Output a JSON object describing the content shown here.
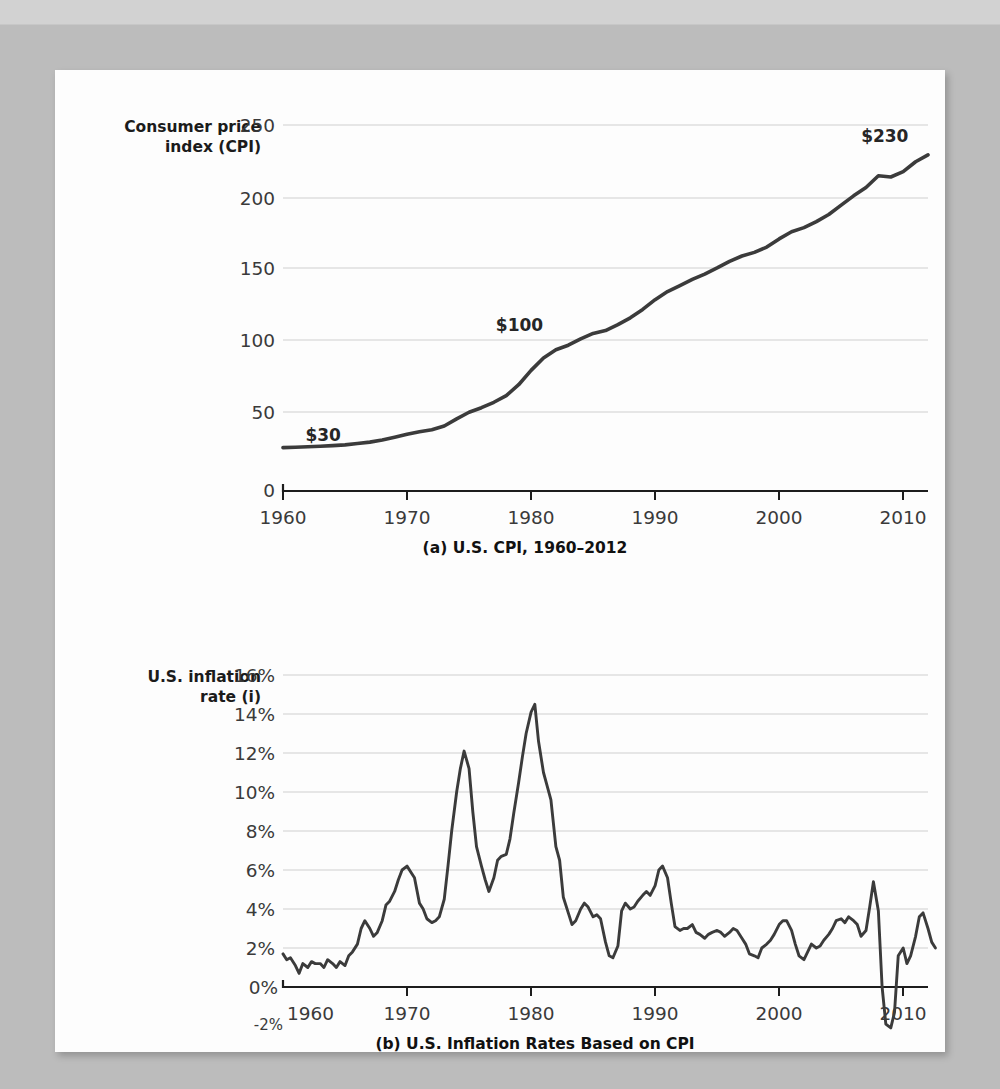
{
  "document": {
    "background_color": "#bcbcbc",
    "card_color": "#fdfdfd"
  },
  "chart_data": [
    {
      "type": "line",
      "id": "cpi",
      "title": "(a) U.S. CPI, 1960–2012",
      "ylabel_line1": "Consumer price",
      "ylabel_line2": "index (CPI)",
      "xlabel": "",
      "xlim": [
        1960,
        2012
      ],
      "ylim": [
        0,
        250
      ],
      "grid": true,
      "legend": "none",
      "yticks": [
        0,
        50,
        100,
        150,
        200,
        250
      ],
      "ytick_labels": [
        "0",
        "50",
        "100",
        "150",
        "200",
        "250"
      ],
      "xticks": [
        1960,
        1970,
        1980,
        1990,
        2000,
        2010
      ],
      "xtick_labels": [
        "1960",
        "1970",
        "1980",
        "1990",
        "2000",
        "2010"
      ],
      "annotations": [
        {
          "text": "$30",
          "x": 1961,
          "y": 29
        },
        {
          "text": "$100",
          "x": 1981,
          "y": 100
        },
        {
          "text": "$230",
          "x": 2009,
          "y": 230
        }
      ],
      "series_name": "U.S. Consumer Price Index",
      "x": [
        1960,
        1961,
        1962,
        1963,
        1964,
        1965,
        1966,
        1967,
        1968,
        1969,
        1970,
        1971,
        1972,
        1973,
        1974,
        1975,
        1976,
        1977,
        1978,
        1979,
        1980,
        1981,
        1982,
        1983,
        1984,
        1985,
        1986,
        1987,
        1988,
        1989,
        1990,
        1991,
        1992,
        1993,
        1994,
        1995,
        1996,
        1997,
        1998,
        1999,
        2000,
        2001,
        2002,
        2003,
        2004,
        2005,
        2006,
        2007,
        2008,
        2009,
        2010,
        2011,
        2012
      ],
      "values": [
        29.6,
        29.9,
        30.2,
        30.6,
        31.0,
        31.5,
        32.4,
        33.4,
        34.8,
        36.7,
        38.8,
        40.5,
        41.8,
        44.4,
        49.3,
        53.8,
        56.9,
        60.6,
        65.2,
        72.6,
        82.4,
        90.9,
        96.5,
        99.6,
        103.9,
        107.6,
        109.6,
        113.6,
        118.3,
        124.0,
        130.7,
        136.2,
        140.3,
        144.5,
        148.2,
        152.4,
        156.9,
        160.5,
        163.0,
        166.6,
        172.2,
        177.1,
        179.9,
        184.0,
        188.9,
        195.3,
        201.6,
        207.3,
        215.3,
        214.5,
        218.1,
        224.9,
        229.6
      ]
    },
    {
      "type": "line",
      "id": "inflation",
      "title": "(b) U.S. Inflation Rates Based on CPI",
      "ylabel_line1": "U.S. inflation",
      "ylabel_line2": "rate (i)",
      "xlabel": "",
      "xlim": [
        1960,
        2012
      ],
      "ylim": [
        -2,
        16
      ],
      "grid": true,
      "legend": "none",
      "yticks": [
        -2,
        0,
        2,
        4,
        6,
        8,
        10,
        12,
        14,
        16
      ],
      "ytick_labels": [
        "-2%",
        "0%",
        "2%",
        "4%",
        "6%",
        "8%",
        "10%",
        "12%",
        "14%",
        "16%"
      ],
      "xticks": [
        1960,
        1970,
        1980,
        1990,
        2000,
        2010
      ],
      "xtick_labels": [
        "1960",
        "1970",
        "1980",
        "1990",
        "2000",
        "2010"
      ],
      "annotations": [],
      "series_name": "U.S. annual inflation rate",
      "x": [
        1960.0,
        1960.3,
        1960.6,
        1961.0,
        1961.3,
        1961.6,
        1962.0,
        1962.3,
        1962.6,
        1963.0,
        1963.3,
        1963.6,
        1964.0,
        1964.3,
        1964.6,
        1965.0,
        1965.3,
        1965.6,
        1966.0,
        1966.3,
        1966.6,
        1967.0,
        1967.3,
        1967.6,
        1968.0,
        1968.3,
        1968.6,
        1969.0,
        1969.3,
        1969.6,
        1970.0,
        1970.3,
        1970.6,
        1971.0,
        1971.3,
        1971.6,
        1972.0,
        1972.3,
        1972.6,
        1973.0,
        1973.3,
        1973.6,
        1974.0,
        1974.3,
        1974.6,
        1975.0,
        1975.3,
        1975.6,
        1976.0,
        1976.3,
        1976.6,
        1977.0,
        1977.3,
        1977.6,
        1978.0,
        1978.3,
        1978.6,
        1979.0,
        1979.3,
        1979.6,
        1980.0,
        1980.3,
        1980.6,
        1981.0,
        1981.3,
        1981.6,
        1982.0,
        1982.3,
        1982.6,
        1983.0,
        1983.3,
        1983.6,
        1984.0,
        1984.3,
        1984.6,
        1985.0,
        1985.3,
        1985.6,
        1986.0,
        1986.3,
        1986.6,
        1987.0,
        1987.3,
        1987.6,
        1988.0,
        1988.3,
        1988.6,
        1989.0,
        1989.3,
        1989.6,
        1990.0,
        1990.3,
        1990.6,
        1991.0,
        1991.3,
        1991.6,
        1992.0,
        1992.3,
        1992.6,
        1993.0,
        1993.3,
        1993.6,
        1994.0,
        1994.3,
        1994.6,
        1995.0,
        1995.3,
        1995.6,
        1996.0,
        1996.3,
        1996.6,
        1997.0,
        1997.3,
        1997.6,
        1998.0,
        1998.3,
        1998.6,
        1999.0,
        1999.3,
        1999.6,
        2000.0,
        2000.3,
        2000.6,
        2001.0,
        2001.3,
        2001.6,
        2002.0,
        2002.3,
        2002.6,
        2003.0,
        2003.3,
        2003.6,
        2004.0,
        2004.3,
        2004.6,
        2005.0,
        2005.3,
        2005.6,
        2006.0,
        2006.3,
        2006.6,
        2007.0,
        2007.3,
        2007.6,
        2008.0,
        2008.3,
        2008.6,
        2009.0,
        2009.3,
        2009.6,
        2010.0,
        2010.3,
        2010.6,
        2011.0,
        2011.3,
        2011.6,
        2012.0,
        2012.3,
        2012.6
      ],
      "values": [
        1.7,
        1.4,
        1.5,
        1.1,
        0.7,
        1.2,
        1.0,
        1.3,
        1.2,
        1.2,
        1.0,
        1.4,
        1.2,
        1.0,
        1.3,
        1.1,
        1.6,
        1.8,
        2.2,
        3.0,
        3.4,
        3.0,
        2.6,
        2.8,
        3.4,
        4.2,
        4.4,
        4.9,
        5.5,
        6.0,
        6.2,
        5.9,
        5.6,
        4.3,
        4.0,
        3.5,
        3.3,
        3.4,
        3.6,
        4.5,
        6.2,
        8.0,
        10.0,
        11.2,
        12.1,
        11.2,
        9.0,
        7.2,
        6.2,
        5.5,
        4.9,
        5.6,
        6.5,
        6.7,
        6.8,
        7.6,
        8.9,
        10.5,
        11.8,
        13.0,
        14.1,
        14.5,
        12.6,
        11.0,
        10.3,
        9.6,
        7.2,
        6.5,
        4.6,
        3.8,
        3.2,
        3.4,
        4.0,
        4.3,
        4.1,
        3.6,
        3.7,
        3.5,
        2.3,
        1.6,
        1.5,
        2.1,
        3.9,
        4.3,
        4.0,
        4.1,
        4.4,
        4.7,
        4.9,
        4.7,
        5.2,
        6.0,
        6.2,
        5.6,
        4.3,
        3.1,
        2.9,
        3.0,
        3.0,
        3.2,
        2.8,
        2.7,
        2.5,
        2.7,
        2.8,
        2.9,
        2.8,
        2.6,
        2.8,
        3.0,
        2.9,
        2.5,
        2.2,
        1.7,
        1.6,
        1.5,
        2.0,
        2.2,
        2.4,
        2.7,
        3.2,
        3.4,
        3.4,
        2.9,
        2.2,
        1.6,
        1.4,
        1.8,
        2.2,
        2.0,
        2.1,
        2.4,
        2.7,
        3.0,
        3.4,
        3.5,
        3.3,
        3.6,
        3.4,
        3.2,
        2.6,
        2.9,
        4.1,
        5.4,
        3.9,
        0.0,
        -1.9,
        -2.1,
        -1.3,
        1.6,
        2.0,
        1.2,
        1.6,
        2.6,
        3.6,
        3.8,
        3.0,
        2.3,
        2.0,
        2.5
      ]
    }
  ]
}
